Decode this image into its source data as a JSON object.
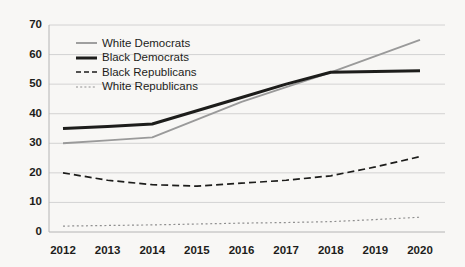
{
  "chart_data": {
    "type": "line",
    "title": "",
    "subtitle": "",
    "xlabel": "",
    "ylabel": "",
    "grid": "horizontal",
    "legend_position": "inside-top-left",
    "x": [
      2012,
      2013,
      2014,
      2015,
      2016,
      2017,
      2018,
      2019,
      2020
    ],
    "categories": [
      "2012",
      "2013",
      "2014",
      "2015",
      "2016",
      "2017",
      "2018",
      "2019",
      "2020"
    ],
    "xlim": [
      2012,
      2020
    ],
    "ylim": [
      0,
      70
    ],
    "yticks": [
      0,
      10,
      20,
      30,
      40,
      50,
      60,
      70
    ],
    "ytick_labels": [
      "0",
      "10",
      "20",
      "30",
      "40",
      "50",
      "60",
      "70"
    ],
    "series": [
      {
        "name": "White Democrats",
        "color": "#9a9a9a",
        "style": "solid",
        "width": 1.9,
        "values": [
          30,
          31,
          32,
          38,
          44,
          49,
          54,
          59.5,
          65
        ]
      },
      {
        "name": "Black Democrats",
        "color": "#1d1d1b",
        "style": "solid",
        "width": 3.0,
        "values": [
          35,
          35.7,
          36.5,
          41,
          45.5,
          50,
          54,
          54.3,
          54.5
        ]
      },
      {
        "name": "Black Republicans",
        "color": "#1d1d1b",
        "style": "dashed",
        "width": 1.7,
        "values": [
          20,
          17.5,
          16,
          15.5,
          16.5,
          17.5,
          19,
          22,
          25.5
        ]
      },
      {
        "name": "White Republicans",
        "color": "#8f8f8f",
        "style": "dotted",
        "width": 1.2,
        "values": [
          2,
          2.2,
          2.4,
          2.7,
          3,
          3.2,
          3.5,
          4.2,
          5
        ]
      }
    ]
  },
  "legend": {
    "items": [
      {
        "label": "White Democrats"
      },
      {
        "label": "Black Democrats"
      },
      {
        "label": "Black Republicans"
      },
      {
        "label": "White Republicans"
      }
    ]
  },
  "colors": {
    "background": "#f8f7f5",
    "grid": "#c9c9c9",
    "axis": "#b4b4b4",
    "text": "#1d1d1b",
    "gray_series": "#9a9a9a",
    "black_series": "#1d1d1b"
  }
}
